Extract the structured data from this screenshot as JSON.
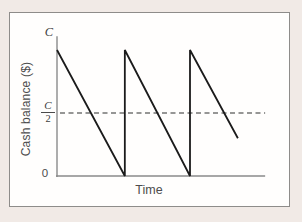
{
  "figure": {
    "ylabel": "Cash balance ($)",
    "xlabel": "Time",
    "y_axis_top_label": "C",
    "half_label_numerator": "C",
    "half_label_denominator": "2",
    "origin_label": "0"
  },
  "colors": {
    "page_background": "#f1eae6",
    "frame_fill": "#fffefd",
    "frame_border": "#8e8c8a",
    "axis": "#8a8a8a",
    "series_line": "#1b1b1b",
    "dashed_reference": "#2e2e2e",
    "label_text": "#4d4d4d"
  },
  "chart_data": {
    "type": "line",
    "title": "",
    "xlabel": "Time",
    "ylabel": "Cash balance ($)",
    "x_unit": "replenishment periods",
    "y_unit": "multiples of C (initial cash balance)",
    "xlim": [
      0,
      3.13
    ],
    "ylim": [
      0,
      1.11
    ],
    "grid": false,
    "legend": false,
    "yticks": [
      {
        "value": 1,
        "label": "C"
      },
      {
        "value": 0.5,
        "label": "C/2"
      },
      {
        "value": 0,
        "label": "0"
      }
    ],
    "series": [
      {
        "name": "cash-balance-sawtooth",
        "points": [
          [
            0,
            1
          ],
          [
            1.02,
            0
          ],
          [
            1.02,
            1
          ],
          [
            2.0,
            0
          ],
          [
            2.0,
            1
          ],
          [
            2.72,
            0.3
          ]
        ]
      }
    ],
    "reference_lines": [
      {
        "name": "average-cash-balance",
        "y": 0.5,
        "label": "C/2",
        "style": "dashed"
      }
    ]
  }
}
